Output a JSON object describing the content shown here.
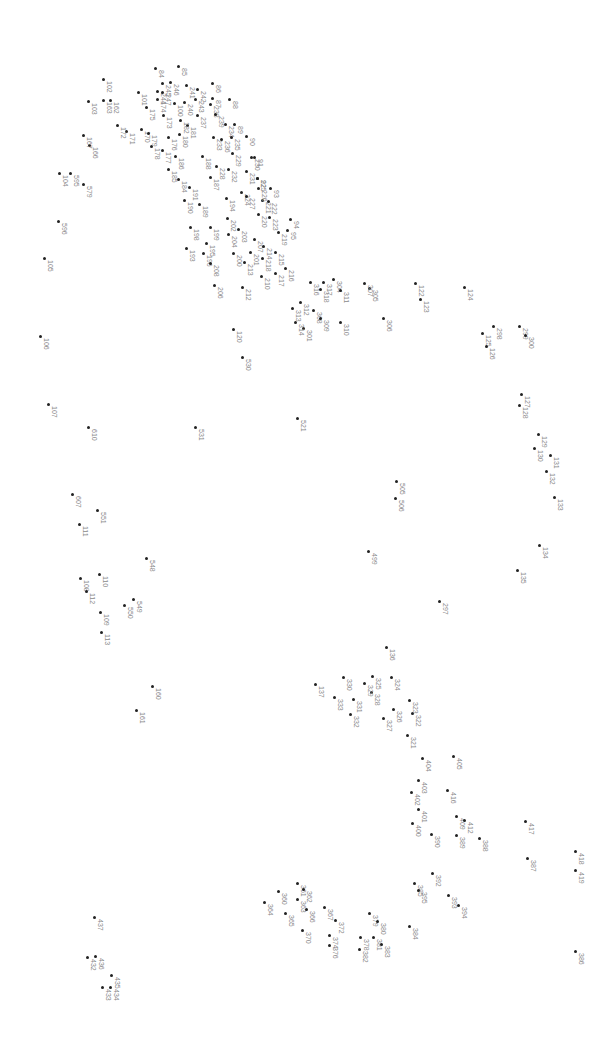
{
  "puzzle": {
    "type": "connect-the-dots",
    "orientation": "rotated-90",
    "dot_color": "#222222",
    "label_color": "#8a8a8a",
    "background": "#ffffff",
    "points": [
      {
        "n": "84",
        "x": 155,
        "y": 68
      },
      {
        "n": "85",
        "x": 178,
        "y": 66
      },
      {
        "n": "86",
        "x": 212,
        "y": 83
      },
      {
        "n": "87",
        "x": 212,
        "y": 98
      },
      {
        "n": "88",
        "x": 229,
        "y": 99
      },
      {
        "n": "89",
        "x": 234,
        "y": 124
      },
      {
        "n": "90",
        "x": 246,
        "y": 136
      },
      {
        "n": "91",
        "x": 254,
        "y": 157
      },
      {
        "n": "92",
        "x": 257,
        "y": 178
      },
      {
        "n": "93",
        "x": 270,
        "y": 188
      },
      {
        "n": "94",
        "x": 290,
        "y": 219
      },
      {
        "n": "95",
        "x": 287,
        "y": 230
      },
      {
        "n": "100",
        "x": 174,
        "y": 103
      },
      {
        "n": "101",
        "x": 138,
        "y": 92
      },
      {
        "n": "102",
        "x": 103,
        "y": 79
      },
      {
        "n": "103",
        "x": 88,
        "y": 101
      },
      {
        "n": "104",
        "x": 59,
        "y": 173
      },
      {
        "n": "105",
        "x": 44,
        "y": 258
      },
      {
        "n": "106",
        "x": 40,
        "y": 336
      },
      {
        "n": "107",
        "x": 48,
        "y": 404
      },
      {
        "n": "108",
        "x": 80,
        "y": 578
      },
      {
        "n": "109",
        "x": 100,
        "y": 612
      },
      {
        "n": "110",
        "x": 99,
        "y": 574
      },
      {
        "n": "111",
        "x": 79,
        "y": 524
      },
      {
        "n": "112",
        "x": 86,
        "y": 591
      },
      {
        "n": "113",
        "x": 101,
        "y": 632
      },
      {
        "n": "120",
        "x": 233,
        "y": 329
      },
      {
        "n": "122",
        "x": 415,
        "y": 283
      },
      {
        "n": "123",
        "x": 420,
        "y": 299
      },
      {
        "n": "124",
        "x": 464,
        "y": 287
      },
      {
        "n": "125",
        "x": 482,
        "y": 333
      },
      {
        "n": "126",
        "x": 486,
        "y": 346
      },
      {
        "n": "127",
        "x": 521,
        "y": 394
      },
      {
        "n": "128",
        "x": 519,
        "y": 405
      },
      {
        "n": "129",
        "x": 538,
        "y": 434
      },
      {
        "n": "130",
        "x": 534,
        "y": 448
      },
      {
        "n": "131",
        "x": 550,
        "y": 455
      },
      {
        "n": "132",
        "x": 546,
        "y": 471
      },
      {
        "n": "133",
        "x": 554,
        "y": 497
      },
      {
        "n": "134",
        "x": 539,
        "y": 545
      },
      {
        "n": "135",
        "x": 517,
        "y": 570
      },
      {
        "n": "136",
        "x": 386,
        "y": 647
      },
      {
        "n": "137",
        "x": 315,
        "y": 684
      },
      {
        "n": "160",
        "x": 152,
        "y": 686
      },
      {
        "n": "161",
        "x": 136,
        "y": 710
      },
      {
        "n": "162",
        "x": 110,
        "y": 100
      },
      {
        "n": "163",
        "x": 103,
        "y": 100
      },
      {
        "n": "166",
        "x": 89,
        "y": 145
      },
      {
        "n": "167",
        "x": 83,
        "y": 135
      },
      {
        "n": "170",
        "x": 141,
        "y": 129
      },
      {
        "n": "171",
        "x": 126,
        "y": 131
      },
      {
        "n": "172",
        "x": 117,
        "y": 125
      },
      {
        "n": "173",
        "x": 163,
        "y": 115
      },
      {
        "n": "174",
        "x": 157,
        "y": 99
      },
      {
        "n": "175",
        "x": 146,
        "y": 107
      },
      {
        "n": "176",
        "x": 168,
        "y": 137
      },
      {
        "n": "177",
        "x": 162,
        "y": 150
      },
      {
        "n": "178",
        "x": 151,
        "y": 146
      },
      {
        "n": "179",
        "x": 148,
        "y": 133
      },
      {
        "n": "180",
        "x": 179,
        "y": 134
      },
      {
        "n": "181",
        "x": 187,
        "y": 125
      },
      {
        "n": "182",
        "x": 180,
        "y": 120
      },
      {
        "n": "184",
        "x": 178,
        "y": 179
      },
      {
        "n": "185",
        "x": 168,
        "y": 169
      },
      {
        "n": "186",
        "x": 175,
        "y": 156
      },
      {
        "n": "187",
        "x": 210,
        "y": 177
      },
      {
        "n": "188",
        "x": 202,
        "y": 156
      },
      {
        "n": "189",
        "x": 199,
        "y": 204
      },
      {
        "n": "190",
        "x": 184,
        "y": 200
      },
      {
        "n": "191",
        "x": 189,
        "y": 187
      },
      {
        "n": "193",
        "x": 186,
        "y": 248
      },
      {
        "n": "194",
        "x": 226,
        "y": 198
      },
      {
        "n": "195",
        "x": 206,
        "y": 243
      },
      {
        "n": "196",
        "x": 203,
        "y": 253
      },
      {
        "n": "198",
        "x": 190,
        "y": 227
      },
      {
        "n": "199",
        "x": 210,
        "y": 227
      },
      {
        "n": "200",
        "x": 233,
        "y": 253
      },
      {
        "n": "201",
        "x": 250,
        "y": 252
      },
      {
        "n": "202",
        "x": 227,
        "y": 218
      },
      {
        "n": "203",
        "x": 238,
        "y": 229
      },
      {
        "n": "204",
        "x": 228,
        "y": 234
      },
      {
        "n": "206",
        "x": 214,
        "y": 285
      },
      {
        "n": "207",
        "x": 254,
        "y": 239
      },
      {
        "n": "208",
        "x": 210,
        "y": 263
      },
      {
        "n": "210",
        "x": 261,
        "y": 276
      },
      {
        "n": "212",
        "x": 242,
        "y": 287
      },
      {
        "n": "213",
        "x": 244,
        "y": 262
      },
      {
        "n": "214",
        "x": 263,
        "y": 246
      },
      {
        "n": "215",
        "x": 275,
        "y": 252
      },
      {
        "n": "216",
        "x": 285,
        "y": 268
      },
      {
        "n": "217",
        "x": 275,
        "y": 273
      },
      {
        "n": "218",
        "x": 262,
        "y": 258
      },
      {
        "n": "219",
        "x": 278,
        "y": 232
      },
      {
        "n": "220",
        "x": 258,
        "y": 214
      },
      {
        "n": "221",
        "x": 262,
        "y": 200
      },
      {
        "n": "222",
        "x": 268,
        "y": 201
      },
      {
        "n": "223",
        "x": 269,
        "y": 217
      },
      {
        "n": "224",
        "x": 241,
        "y": 192
      },
      {
        "n": "225",
        "x": 257,
        "y": 178
      },
      {
        "n": "226",
        "x": 258,
        "y": 188
      },
      {
        "n": "227",
        "x": 246,
        "y": 196
      },
      {
        "n": "228",
        "x": 216,
        "y": 166
      },
      {
        "n": "229",
        "x": 232,
        "y": 153
      },
      {
        "n": "230",
        "x": 251,
        "y": 157
      },
      {
        "n": "231",
        "x": 246,
        "y": 171
      },
      {
        "n": "232",
        "x": 228,
        "y": 169
      },
      {
        "n": "233",
        "x": 213,
        "y": 137
      },
      {
        "n": "234",
        "x": 225,
        "y": 124
      },
      {
        "n": "235",
        "x": 231,
        "y": 137
      },
      {
        "n": "236",
        "x": 221,
        "y": 139
      },
      {
        "n": "237",
        "x": 197,
        "y": 115
      },
      {
        "n": "238",
        "x": 210,
        "y": 104
      },
      {
        "n": "239",
        "x": 215,
        "y": 114
      },
      {
        "n": "240",
        "x": 184,
        "y": 102
      },
      {
        "n": "241",
        "x": 186,
        "y": 85
      },
      {
        "n": "242",
        "x": 197,
        "y": 89
      },
      {
        "n": "243",
        "x": 195,
        "y": 99
      },
      {
        "n": "244",
        "x": 157,
        "y": 91
      },
      {
        "n": "245",
        "x": 162,
        "y": 83
      },
      {
        "n": "246",
        "x": 170,
        "y": 82
      },
      {
        "n": "247",
        "x": 162,
        "y": 92
      },
      {
        "n": "297",
        "x": 439,
        "y": 601
      },
      {
        "n": "298",
        "x": 493,
        "y": 326
      },
      {
        "n": "299",
        "x": 519,
        "y": 326
      },
      {
        "n": "300",
        "x": 525,
        "y": 335
      },
      {
        "n": "301",
        "x": 303,
        "y": 328
      },
      {
        "n": "304",
        "x": 333,
        "y": 279
      },
      {
        "n": "305",
        "x": 369,
        "y": 288
      },
      {
        "n": "306",
        "x": 383,
        "y": 318
      },
      {
        "n": "307",
        "x": 364,
        "y": 283
      },
      {
        "n": "308",
        "x": 313,
        "y": 310
      },
      {
        "n": "309",
        "x": 320,
        "y": 318
      },
      {
        "n": "310",
        "x": 340,
        "y": 322
      },
      {
        "n": "311",
        "x": 340,
        "y": 290
      },
      {
        "n": "312",
        "x": 300,
        "y": 302
      },
      {
        "n": "313",
        "x": 292,
        "y": 308
      },
      {
        "n": "314",
        "x": 295,
        "y": 322
      },
      {
        "n": "316",
        "x": 310,
        "y": 282
      },
      {
        "n": "317",
        "x": 323,
        "y": 282
      },
      {
        "n": "318",
        "x": 320,
        "y": 289
      },
      {
        "n": "321",
        "x": 407,
        "y": 735
      },
      {
        "n": "322",
        "x": 412,
        "y": 713
      },
      {
        "n": "323",
        "x": 409,
        "y": 700
      },
      {
        "n": "324",
        "x": 391,
        "y": 677
      },
      {
        "n": "325",
        "x": 372,
        "y": 676
      },
      {
        "n": "326",
        "x": 393,
        "y": 709
      },
      {
        "n": "327",
        "x": 383,
        "y": 718
      },
      {
        "n": "328",
        "x": 371,
        "y": 692
      },
      {
        "n": "329",
        "x": 364,
        "y": 683
      },
      {
        "n": "330",
        "x": 343,
        "y": 677
      },
      {
        "n": "331",
        "x": 353,
        "y": 699
      },
      {
        "n": "332",
        "x": 350,
        "y": 714
      },
      {
        "n": "333",
        "x": 334,
        "y": 697
      },
      {
        "n": "360",
        "x": 278,
        "y": 891
      },
      {
        "n": "361",
        "x": 297,
        "y": 883
      },
      {
        "n": "362",
        "x": 303,
        "y": 889
      },
      {
        "n": "363",
        "x": 297,
        "y": 899
      },
      {
        "n": "364",
        "x": 264,
        "y": 902
      },
      {
        "n": "365",
        "x": 285,
        "y": 913
      },
      {
        "n": "366",
        "x": 306,
        "y": 909
      },
      {
        "n": "367",
        "x": 324,
        "y": 907
      },
      {
        "n": "370",
        "x": 302,
        "y": 930
      },
      {
        "n": "372",
        "x": 335,
        "y": 920
      },
      {
        "n": "374",
        "x": 329,
        "y": 935
      },
      {
        "n": "376",
        "x": 329,
        "y": 945
      },
      {
        "n": "378",
        "x": 360,
        "y": 937
      },
      {
        "n": "379",
        "x": 369,
        "y": 913
      },
      {
        "n": "380",
        "x": 377,
        "y": 921
      },
      {
        "n": "381",
        "x": 373,
        "y": 937
      },
      {
        "n": "382",
        "x": 359,
        "y": 949
      },
      {
        "n": "383",
        "x": 381,
        "y": 944
      },
      {
        "n": "384",
        "x": 409,
        "y": 926
      },
      {
        "n": "385",
        "x": 414,
        "y": 883
      },
      {
        "n": "386",
        "x": 575,
        "y": 951
      },
      {
        "n": "387",
        "x": 527,
        "y": 858
      },
      {
        "n": "388",
        "x": 479,
        "y": 838
      },
      {
        "n": "389",
        "x": 456,
        "y": 835
      },
      {
        "n": "390",
        "x": 431,
        "y": 834
      },
      {
        "n": "392",
        "x": 432,
        "y": 873
      },
      {
        "n": "393",
        "x": 448,
        "y": 895
      },
      {
        "n": "394",
        "x": 458,
        "y": 905
      },
      {
        "n": "395",
        "x": 418,
        "y": 890
      },
      {
        "n": "400",
        "x": 412,
        "y": 823
      },
      {
        "n": "401",
        "x": 418,
        "y": 809
      },
      {
        "n": "402",
        "x": 411,
        "y": 792
      },
      {
        "n": "403",
        "x": 418,
        "y": 780
      },
      {
        "n": "404",
        "x": 422,
        "y": 758
      },
      {
        "n": "405",
        "x": 453,
        "y": 756
      },
      {
        "n": "409",
        "x": 456,
        "y": 816
      },
      {
        "n": "412",
        "x": 464,
        "y": 820
      },
      {
        "n": "416",
        "x": 447,
        "y": 790
      },
      {
        "n": "417",
        "x": 525,
        "y": 821
      },
      {
        "n": "418",
        "x": 575,
        "y": 851
      },
      {
        "n": "419",
        "x": 575,
        "y": 870
      },
      {
        "n": "432",
        "x": 87,
        "y": 957
      },
      {
        "n": "433",
        "x": 102,
        "y": 987
      },
      {
        "n": "434",
        "x": 110,
        "y": 987
      },
      {
        "n": "435",
        "x": 111,
        "y": 975
      },
      {
        "n": "436",
        "x": 95,
        "y": 956
      },
      {
        "n": "437",
        "x": 94,
        "y": 917
      },
      {
        "n": "499",
        "x": 368,
        "y": 551
      },
      {
        "n": "505",
        "x": 396,
        "y": 481
      },
      {
        "n": "506",
        "x": 395,
        "y": 498
      },
      {
        "n": "521",
        "x": 297,
        "y": 418
      },
      {
        "n": "530",
        "x": 242,
        "y": 357
      },
      {
        "n": "531",
        "x": 195,
        "y": 427
      },
      {
        "n": "548",
        "x": 146,
        "y": 558
      },
      {
        "n": "549",
        "x": 133,
        "y": 599
      },
      {
        "n": "550",
        "x": 124,
        "y": 605
      },
      {
        "n": "551",
        "x": 97,
        "y": 510
      },
      {
        "n": "579",
        "x": 83,
        "y": 184
      },
      {
        "n": "595",
        "x": 70,
        "y": 173
      },
      {
        "n": "596",
        "x": 58,
        "y": 221
      },
      {
        "n": "607",
        "x": 72,
        "y": 494
      },
      {
        "n": "610",
        "x": 88,
        "y": 427
      }
    ]
  }
}
